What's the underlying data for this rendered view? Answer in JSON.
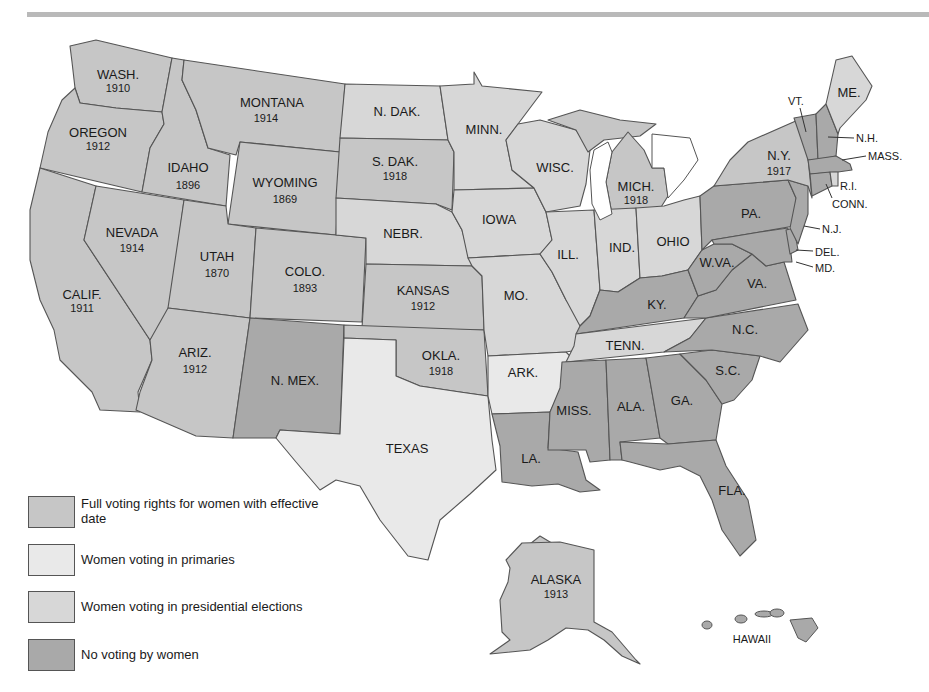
{
  "map": {
    "title": "Women's Suffrage in the United States before the 19th Amendment",
    "colors": {
      "full": "#c6c6c6",
      "primaries": "#e9e9e9",
      "presidential": "#d7d7d7",
      "none": "#a9a9a9",
      "border": "#555555",
      "water": "#ffffff",
      "top_rule": "#b9b9b9"
    },
    "states": [
      {
        "abbr": "WASH.",
        "year": "1910",
        "status": "full"
      },
      {
        "abbr": "OREGON",
        "year": "1912",
        "status": "full"
      },
      {
        "abbr": "CALIF.",
        "year": "1911",
        "status": "full"
      },
      {
        "abbr": "IDAHO",
        "year": "1896",
        "status": "full"
      },
      {
        "abbr": "NEVADA",
        "year": "1914",
        "status": "full"
      },
      {
        "abbr": "MONTANA",
        "year": "1914",
        "status": "full"
      },
      {
        "abbr": "WYOMING",
        "year": "1869",
        "status": "full"
      },
      {
        "abbr": "UTAH",
        "year": "1870",
        "status": "full"
      },
      {
        "abbr": "COLO.",
        "year": "1893",
        "status": "full"
      },
      {
        "abbr": "ARIZ.",
        "year": "1912",
        "status": "full"
      },
      {
        "abbr": "N. MEX.",
        "year": "",
        "status": "none"
      },
      {
        "abbr": "N. DAK.",
        "year": "",
        "status": "presidential"
      },
      {
        "abbr": "S. DAK.",
        "year": "1918",
        "status": "full"
      },
      {
        "abbr": "NEBR.",
        "year": "",
        "status": "presidential"
      },
      {
        "abbr": "KANSAS",
        "year": "1912",
        "status": "full"
      },
      {
        "abbr": "OKLA.",
        "year": "1918",
        "status": "full"
      },
      {
        "abbr": "TEXAS",
        "year": "",
        "status": "primaries"
      },
      {
        "abbr": "MINN.",
        "year": "",
        "status": "presidential"
      },
      {
        "abbr": "IOWA",
        "year": "",
        "status": "presidential"
      },
      {
        "abbr": "MO.",
        "year": "",
        "status": "presidential"
      },
      {
        "abbr": "ARK.",
        "year": "",
        "status": "primaries"
      },
      {
        "abbr": "LA.",
        "year": "",
        "status": "none"
      },
      {
        "abbr": "WISC.",
        "year": "",
        "status": "presidential"
      },
      {
        "abbr": "ILL.",
        "year": "",
        "status": "presidential"
      },
      {
        "abbr": "MICH.",
        "year": "1918",
        "status": "full"
      },
      {
        "abbr": "IND.",
        "year": "",
        "status": "presidential"
      },
      {
        "abbr": "OHIO",
        "year": "",
        "status": "presidential"
      },
      {
        "abbr": "KY.",
        "year": "",
        "status": "none"
      },
      {
        "abbr": "TENN.",
        "year": "",
        "status": "presidential"
      },
      {
        "abbr": "MISS.",
        "year": "",
        "status": "none"
      },
      {
        "abbr": "ALA.",
        "year": "",
        "status": "none"
      },
      {
        "abbr": "GA.",
        "year": "",
        "status": "none"
      },
      {
        "abbr": "FLA.",
        "year": "",
        "status": "none"
      },
      {
        "abbr": "S.C.",
        "year": "",
        "status": "none"
      },
      {
        "abbr": "N.C.",
        "year": "",
        "status": "none"
      },
      {
        "abbr": "VA.",
        "year": "",
        "status": "none"
      },
      {
        "abbr": "W.VA.",
        "year": "",
        "status": "none"
      },
      {
        "abbr": "PA.",
        "year": "",
        "status": "none"
      },
      {
        "abbr": "N.Y.",
        "year": "1917",
        "status": "full"
      },
      {
        "abbr": "VT.",
        "year": "",
        "status": "none"
      },
      {
        "abbr": "N.H.",
        "year": "",
        "status": "none"
      },
      {
        "abbr": "ME.",
        "year": "",
        "status": "presidential"
      },
      {
        "abbr": "MASS.",
        "year": "",
        "status": "none"
      },
      {
        "abbr": "R.I.",
        "year": "",
        "status": "presidential"
      },
      {
        "abbr": "CONN.",
        "year": "",
        "status": "none"
      },
      {
        "abbr": "N.J.",
        "year": "",
        "status": "none"
      },
      {
        "abbr": "DEL.",
        "year": "",
        "status": "none"
      },
      {
        "abbr": "MD.",
        "year": "",
        "status": "none"
      },
      {
        "abbr": "ALASKA",
        "year": "1913",
        "status": "full"
      },
      {
        "abbr": "HAWAII",
        "year": "",
        "status": "none"
      }
    ]
  },
  "legend": {
    "items": [
      {
        "key": "full",
        "label": "Full voting rights for women with effective date"
      },
      {
        "key": "primaries",
        "label": "Women voting in primaries"
      },
      {
        "key": "presidential",
        "label": "Women voting in presidential elections"
      },
      {
        "key": "none",
        "label": "No voting by women"
      }
    ]
  }
}
